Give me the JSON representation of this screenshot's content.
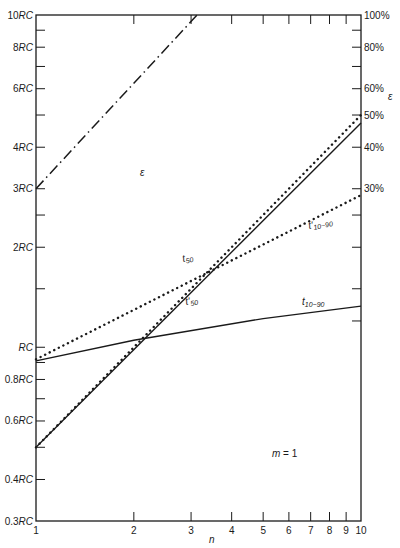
{
  "chart_data": {
    "type": "line",
    "title": "",
    "xlabel": "n",
    "ylabel_left": "RC",
    "ylabel_right": "ε",
    "x_scale": "log",
    "y_scale": "log",
    "xlim": [
      1,
      10
    ],
    "ylim": [
      0.3,
      10
    ],
    "x_ticks": [
      "1",
      "2",
      "3",
      "4",
      "5",
      "6",
      "7",
      "8",
      "9",
      "10"
    ],
    "x_tick_values": [
      1,
      2,
      3,
      4,
      5,
      6,
      7,
      8,
      9,
      10
    ],
    "y_left_ticks": [
      {
        "value": 0.3,
        "label": "0.3RC"
      },
      {
        "value": 0.4,
        "label": "0.4RC"
      },
      {
        "value": 0.5,
        "label": ""
      },
      {
        "value": 0.6,
        "label": "0.6RC"
      },
      {
        "value": 0.7,
        "label": ""
      },
      {
        "value": 0.8,
        "label": "0.8RC"
      },
      {
        "value": 0.9,
        "label": ""
      },
      {
        "value": 1,
        "label": "RC"
      },
      {
        "value": 1.5,
        "label": ""
      },
      {
        "value": 2,
        "label": "2RC"
      },
      {
        "value": 2.5,
        "label": ""
      },
      {
        "value": 3,
        "label": "3RC"
      },
      {
        "value": 4,
        "label": "4RC"
      },
      {
        "value": 5,
        "label": ""
      },
      {
        "value": 6,
        "label": "6RC"
      },
      {
        "value": 7,
        "label": ""
      },
      {
        "value": 8,
        "label": "8RC"
      },
      {
        "value": 9,
        "label": ""
      },
      {
        "value": 10,
        "label": "10RC"
      }
    ],
    "y_right_ticks": [
      {
        "value": 3,
        "label": "30%"
      },
      {
        "value": 4,
        "label": "40%"
      },
      {
        "value": 5,
        "label": "50%"
      },
      {
        "value": 6,
        "label": "60%"
      },
      {
        "value": 8,
        "label": "80%"
      },
      {
        "value": 10,
        "label": "100%"
      },
      {
        "value": 1.2,
        "label": ""
      },
      {
        "value": 1.5,
        "label": ""
      },
      {
        "value": 2,
        "label": ""
      },
      {
        "value": 2.5,
        "label": ""
      },
      {
        "value": 7,
        "label": ""
      },
      {
        "value": 9,
        "label": ""
      }
    ],
    "series": [
      {
        "name": "ε",
        "style": "dash-dot",
        "x": [
          1,
          3.13
        ],
        "y": [
          3.0,
          10.0
        ],
        "label_pos": {
          "x": 2.9,
          "y": 7.0
        }
      },
      {
        "name": "t50",
        "style": "solid",
        "x": [
          1,
          10
        ],
        "y": [
          0.5,
          4.73
        ],
        "label_pos": {
          "x": 2.9,
          "y": 1.7
        }
      },
      {
        "name": "t'50",
        "style": "dotted",
        "x": [
          1,
          10
        ],
        "y": [
          0.5,
          5.0
        ],
        "label_pos": {
          "x": 3.0,
          "y": 1.42
        }
      },
      {
        "name": "t10-90",
        "style": "solid",
        "x": [
          1,
          2,
          5,
          10
        ],
        "y": [
          0.91,
          1.05,
          1.22,
          1.33
        ],
        "label_pos": {
          "x": 6.3,
          "y": 1.4
        }
      },
      {
        "name": "t'10-90",
        "style": "dotted",
        "x": [
          1,
          10
        ],
        "y": [
          0.92,
          2.87
        ],
        "label_pos": {
          "x": 7.4,
          "y": 2.45
        }
      }
    ],
    "annotations": [
      {
        "text": "m = 1",
        "x": 5.5,
        "y": 0.5
      }
    ],
    "grid": false,
    "legend": "inline labels"
  },
  "labels": {
    "eps": "ε",
    "eps_axis": "ε",
    "t50_main": "t",
    "t50_sub": "50",
    "t50p_main": "t'",
    "t50p_sub": "50",
    "t1090_main": "t",
    "t1090_sub": "10−90",
    "t1090p_main": "t'",
    "t1090p_sub": "10−90",
    "m_eq": "m = 1",
    "n_axis": "n"
  }
}
